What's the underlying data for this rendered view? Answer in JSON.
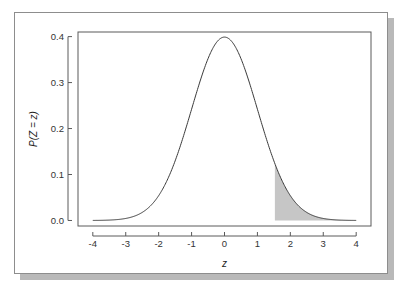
{
  "figure": {
    "caption": "",
    "card_bg": "#ffffff",
    "border_color": "#8d8d8d",
    "shadow_color": "#b9b9b9"
  },
  "chart_data": {
    "type": "area",
    "title": "",
    "subtitle": "",
    "xlabel": "z",
    "ylabel": "P(Z = z)",
    "xlim": [
      -4.45,
      4.45
    ],
    "ylim": [
      -0.012,
      0.41
    ],
    "grid": false,
    "legend": null,
    "curve_color": "#3a3a3a",
    "shade_color": "#c6c6c6",
    "xticks": [
      -4,
      -3,
      -2,
      -1,
      0,
      1,
      2,
      3,
      4
    ],
    "xtick_labels": [
      "-4",
      "-3",
      "-2",
      "-1",
      "0",
      "1",
      "2",
      "3",
      "4"
    ],
    "yticks": [
      0.0,
      0.1,
      0.2,
      0.3,
      0.4
    ],
    "ytick_labels": [
      "0.0",
      "0.1",
      "0.2",
      "0.3",
      "0.4"
    ],
    "distribution": "standard normal",
    "mean": 0,
    "sd": 1,
    "shaded_region": {
      "from": 1.53,
      "to": 4,
      "description": "upper tail",
      "area": 0.063
    },
    "x": [
      -4,
      -3.8,
      -3.6,
      -3.4,
      -3.2,
      -3,
      -2.8,
      -2.6,
      -2.4,
      -2.2,
      -2,
      -1.8,
      -1.6,
      -1.4,
      -1.2,
      -1,
      -0.8,
      -0.6,
      -0.4,
      -0.2,
      0,
      0.2,
      0.4,
      0.6,
      0.8,
      1,
      1.2,
      1.4,
      1.53,
      1.6,
      1.8,
      2,
      2.2,
      2.4,
      2.6,
      2.8,
      3,
      3.2,
      3.4,
      3.6,
      3.8,
      4
    ],
    "y": [
      0.0001,
      0.0003,
      0.0006,
      0.0012,
      0.0024,
      0.0044,
      0.0079,
      0.0136,
      0.0224,
      0.0355,
      0.054,
      0.079,
      0.1109,
      0.1497,
      0.1942,
      0.242,
      0.2897,
      0.3332,
      0.3683,
      0.391,
      0.3989,
      0.391,
      0.3683,
      0.3332,
      0.2897,
      0.242,
      0.1942,
      0.1497,
      0.1238,
      0.1109,
      0.079,
      0.054,
      0.0355,
      0.0224,
      0.0136,
      0.0079,
      0.0044,
      0.0024,
      0.0012,
      0.0006,
      0.0003,
      0.0001
    ]
  }
}
